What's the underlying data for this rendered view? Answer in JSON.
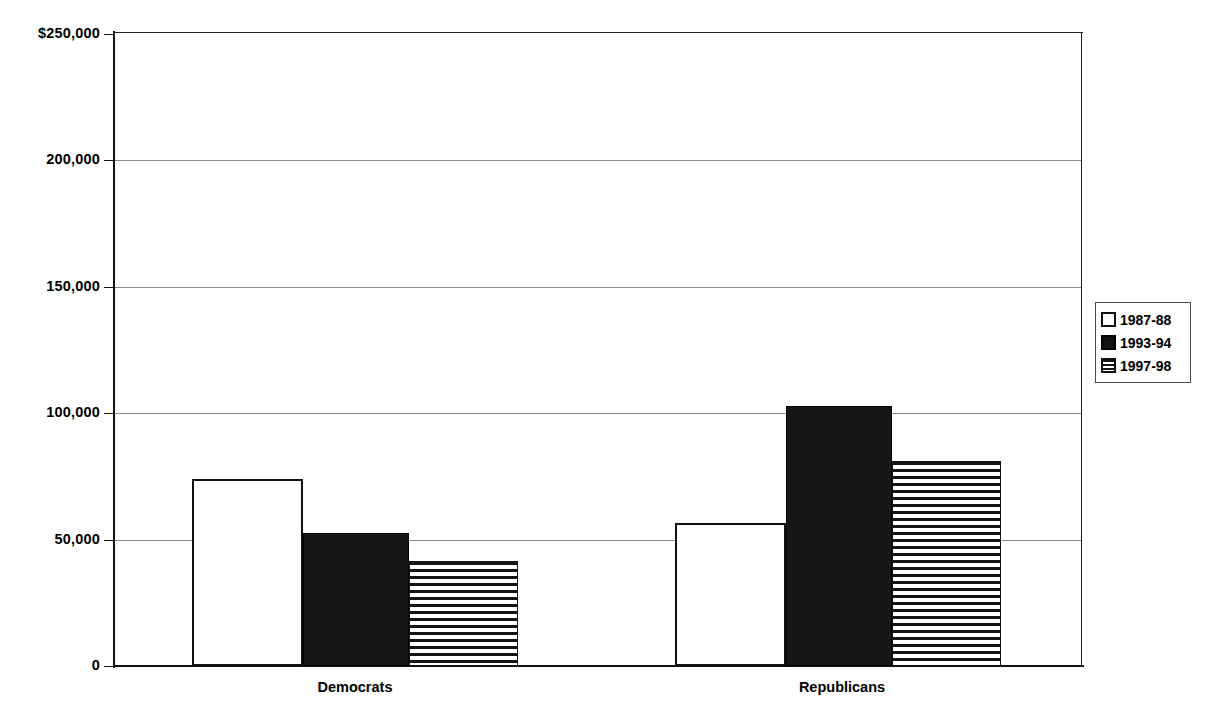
{
  "chart_data": {
    "type": "bar",
    "title": "",
    "subtitle": "",
    "xlabel": "",
    "ylabel": "",
    "categories": [
      "Democrats",
      "Republicans"
    ],
    "series": [
      {
        "name": "1987-88",
        "pattern": "empty",
        "values": [
          74000,
          56500
        ]
      },
      {
        "name": "1993-94",
        "pattern": "solid",
        "values": [
          52500,
          103000
        ]
      },
      {
        "name": "1997-98",
        "pattern": "striped",
        "values": [
          41500,
          81000
        ]
      }
    ],
    "ylim": [
      0,
      250000
    ],
    "yticks": [
      0,
      50000,
      100000,
      150000,
      200000,
      250000
    ],
    "ytick_labels": [
      "0",
      "50,000",
      "100,000",
      "150,000",
      "200,000",
      "$250,000"
    ],
    "grid": true,
    "legend_position": "right"
  },
  "axis": {
    "y_labels": [
      {
        "text": "$250,000",
        "value": 250000
      },
      {
        "text": "200,000",
        "value": 200000
      },
      {
        "text": "150,000",
        "value": 150000
      },
      {
        "text": "100,000",
        "value": 100000
      },
      {
        "text": "50,000",
        "value": 50000
      },
      {
        "text": "0",
        "value": 0
      }
    ],
    "x_labels": [
      "Democrats",
      "Republicans"
    ]
  },
  "legend": {
    "items": [
      {
        "label": "1987-88",
        "pattern": "empty"
      },
      {
        "label": "1993-94",
        "pattern": "solid"
      },
      {
        "label": "1997-98",
        "pattern": "striped"
      }
    ]
  },
  "colors": {
    "background": "#ffffff",
    "axis": "#111111",
    "gridline": "#8d8d8d",
    "bar_fill_solid": "#161616",
    "bar_fill_empty": "#ffffff",
    "bar_stripe": "#141414"
  }
}
